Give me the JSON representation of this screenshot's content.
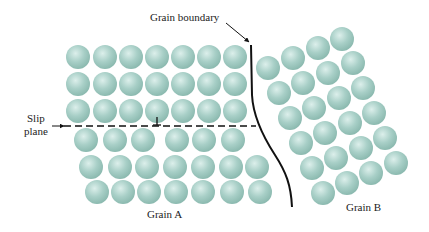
{
  "labels": {
    "grain_boundary": "Grain boundary",
    "slip_plane_line1": "Slip",
    "slip_plane_line2": "plane",
    "grain_a": "Grain A",
    "grain_b": "Grain B"
  },
  "colors": {
    "atom_fill": "#a8cfc7",
    "atom_highlight": "#dcefeb",
    "atom_edge": "#8cbab0",
    "line": "#111111",
    "text": "#222222"
  },
  "atom_radius": 12,
  "grain_a": {
    "rows": [
      {
        "y": 57,
        "x": [
          78,
          105,
          131,
          157,
          183,
          209,
          235
        ]
      },
      {
        "y": 84,
        "x": [
          78,
          105,
          131,
          157,
          183,
          209,
          235
        ]
      },
      {
        "y": 111,
        "x": [
          78,
          105,
          131,
          157,
          183,
          209,
          235
        ]
      },
      {
        "y": 140,
        "x": [
          86,
          115,
          143,
          177,
          204,
          233
        ]
      },
      {
        "y": 167,
        "x": [
          91,
          120,
          147,
          175,
          203,
          231,
          257
        ]
      },
      {
        "y": 192,
        "x": [
          97,
          123,
          149,
          176,
          203,
          232,
          260
        ]
      }
    ]
  },
  "grain_b": {
    "rows": [
      [
        [
          268,
          68
        ],
        [
          293,
          58
        ],
        [
          318,
          48
        ],
        [
          342,
          39
        ]
      ],
      [
        [
          279,
          93
        ],
        [
          303,
          83
        ],
        [
          328,
          73
        ],
        [
          353,
          63
        ]
      ],
      [
        [
          290,
          118
        ],
        [
          314,
          108
        ],
        [
          339,
          98
        ],
        [
          363,
          88
        ]
      ],
      [
        [
          301,
          143
        ],
        [
          325,
          133
        ],
        [
          350,
          123
        ],
        [
          374,
          113
        ]
      ],
      [
        [
          312,
          168
        ],
        [
          336,
          158
        ],
        [
          361,
          148
        ],
        [
          385,
          138
        ]
      ],
      [
        [
          323,
          193
        ],
        [
          347,
          183
        ],
        [
          371,
          173
        ],
        [
          396,
          163
        ]
      ]
    ]
  },
  "grain_boundary_curve": "M251,45 L252,95 C253,115 262,135 275,155 C286,172 291,185 292,207",
  "grain_boundary_arrow": {
    "x1": 226,
    "y1": 23,
    "x2": 249,
    "y2": 42
  },
  "slip_plane": {
    "x1": 64,
    "x2": 256,
    "y": 126
  },
  "slip_arrow": {
    "x1": 52,
    "x2": 64,
    "y": 126
  },
  "dislocation": {
    "x": 157,
    "y_top": 117,
    "y_bottom": 125,
    "half_width": 4
  }
}
